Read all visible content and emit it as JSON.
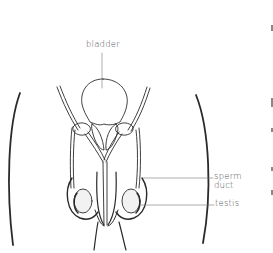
{
  "diagram": {
    "labels": {
      "bladder": "bladder",
      "sperm_duct": "sperm duct",
      "sperm_duct_line1": "sperm",
      "sperm_duct_line2": "duct",
      "testis": "testis"
    },
    "colors": {
      "stroke": "#2a2a2a",
      "leader_line": "#777777",
      "label_text": "#555555",
      "background": "#ffffff",
      "testis_fill": "#f2f2f2"
    }
  }
}
